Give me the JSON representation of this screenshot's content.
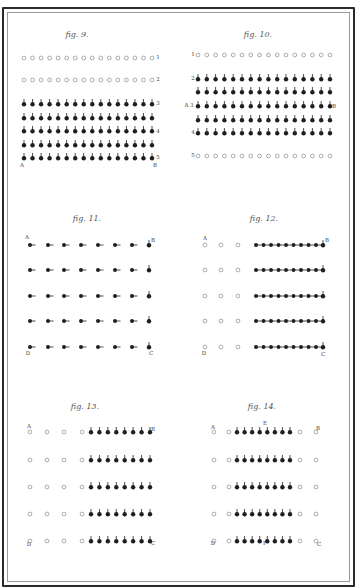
{
  "colors": {
    "ink": "#1f1f1f",
    "open_ink": "#8a8a8a",
    "paper": "#ffffff"
  },
  "figures": [
    {
      "id": "fig9",
      "title": "fig. 9.",
      "rows": [
        {
          "pattern": "O16",
          "right_label": "1"
        },
        {
          "pattern": "O16",
          "right_label": "2"
        },
        {
          "pattern": "U16",
          "right_label": "3"
        },
        {
          "pattern": "U16",
          "right_label": ""
        },
        {
          "pattern": "U16",
          "right_label": "4"
        },
        {
          "pattern": "U16",
          "right_label": ""
        },
        {
          "pattern": "U16",
          "right_label": "5"
        }
      ],
      "corner_labels": {
        "bottom_left": "A",
        "bottom_right": "B"
      }
    },
    {
      "id": "fig10",
      "title": "fig. 10.",
      "rows": [
        {
          "pattern": "O16",
          "left_label": "1"
        },
        {
          "pattern": "U16",
          "left_label": "2"
        },
        {
          "pattern": "U16",
          "left_label": ""
        },
        {
          "pattern": "U16",
          "left_label": "A 3",
          "right_label": "B"
        },
        {
          "pattern": "U16",
          "left_label": ""
        },
        {
          "pattern": "U16",
          "left_label": "4"
        },
        {
          "pattern": "O16",
          "left_label": "5"
        }
      ]
    },
    {
      "id": "fig11",
      "title": "fig. 11.",
      "rows": [
        {
          "pattern": "R7 U1"
        },
        {
          "pattern": "R7 U1"
        },
        {
          "pattern": "R7 U1"
        },
        {
          "pattern": "R7 U1"
        },
        {
          "pattern": "R7 U1"
        }
      ],
      "corner_labels": {
        "top_left": "A",
        "top_right": "B",
        "bottom_left": "D",
        "bottom_right": "C"
      }
    },
    {
      "id": "fig12",
      "title": "fig. 12.",
      "rows": [
        {
          "pattern": "O3 R9 U1"
        },
        {
          "pattern": "O3 R9 U1"
        },
        {
          "pattern": "O3 R9 U1"
        },
        {
          "pattern": "O3 R9 U1"
        },
        {
          "pattern": "O3 R9 U1"
        }
      ],
      "corner_labels": {
        "top_left": "A",
        "top_right": "B",
        "bottom_left": "D",
        "bottom_right": "C"
      }
    },
    {
      "id": "fig13",
      "title": "fig. 13.",
      "rows": [
        {
          "pattern": "O4 U8"
        },
        {
          "pattern": "O4 U8"
        },
        {
          "pattern": "O4 U8"
        },
        {
          "pattern": "O4 U8"
        },
        {
          "pattern": "O4 U8"
        }
      ],
      "corner_labels": {
        "top_left": "A",
        "top_right": "B",
        "bottom_left": "D",
        "bottom_right": "C"
      }
    },
    {
      "id": "fig14",
      "title": "fig. 14.",
      "rows": [
        {
          "pattern": "O2 U8 O2"
        },
        {
          "pattern": "O2 U8 O2"
        },
        {
          "pattern": "O2 U8 O2"
        },
        {
          "pattern": "O2 U8 O2"
        },
        {
          "pattern": "O2 U8 O2"
        }
      ],
      "corner_labels": {
        "top_left": "A",
        "top_center": "E",
        "top_right": "B",
        "bottom_left": "D",
        "bottom_center": "F",
        "bottom_right": "C"
      }
    }
  ],
  "legend_note": {
    "O": "open circle",
    "U": "filled dot, stem up",
    "R": "filled dot, stem right"
  }
}
